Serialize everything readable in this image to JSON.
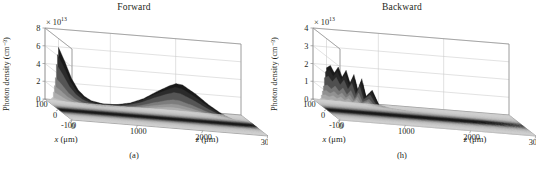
{
  "figure": {
    "background_color": "#ffffff",
    "text_color": "#231f20",
    "panels": [
      {
        "id": "a",
        "title": "Forward",
        "caption": "(a)",
        "ylabel": "Photon density (cm⁻³)",
        "xlabel_var": "x",
        "xlabel_unit": "(μm)",
        "zlabel_var": "z",
        "zlabel_unit": "(μm)",
        "exponent_prefix": "× 10",
        "exponent_power": "13"
      },
      {
        "id": "b",
        "title": "Backward",
        "caption": "(h)",
        "ylabel": "Photon density (cm⁻³)",
        "xlabel_var": "x",
        "xlabel_unit": "(μm)",
        "zlabel_var": "z",
        "zlabel_unit": "(μm)",
        "exponent_prefix": "× 10",
        "exponent_power": "13"
      }
    ]
  },
  "chart_data": [
    {
      "type": "surface",
      "panel": "a",
      "title": "Forward",
      "caption": "(a)",
      "xlabel": "x (μm)",
      "ylabel": "Photon density (cm⁻³)",
      "zlabel": "z (μm)",
      "y_exponent": 13,
      "y_exponent_label": "× 10¹³",
      "ylim": [
        0,
        8
      ],
      "yticks": [
        0,
        2,
        4,
        6,
        8
      ],
      "xlim": [
        -100,
        100
      ],
      "xticks": [
        100,
        0,
        -100
      ],
      "zlim": [
        0,
        3000
      ],
      "zticks": [
        0,
        1000,
        2000,
        3000
      ],
      "grid": true,
      "legend": "none",
      "surface_color_low": "#d2d2d2",
      "surface_color_high": "#1c1c1c",
      "description": "Sharp tall photon-density spike at z near 0 reaching about 7e13, decaying rapidly, followed by a broad secondary hump centred near z = 1800 peaking near 4e13, narrow in x about x = 0.",
      "z_profile": {
        "z": [
          0,
          100,
          200,
          300,
          400,
          500,
          700,
          900,
          1100,
          1300,
          1500,
          1700,
          1800,
          1900,
          2100,
          2300,
          2500,
          2700,
          3000
        ],
        "peak_value": [
          7.0,
          5.4,
          3.6,
          2.4,
          1.7,
          1.3,
          1.0,
          1.1,
          1.4,
          2.0,
          2.9,
          3.7,
          4.0,
          3.9,
          3.0,
          1.9,
          1.0,
          0.4,
          0.05
        ]
      },
      "x_profile": {
        "x": [
          -100,
          -70,
          -45,
          -25,
          -12,
          0,
          12,
          25,
          45,
          70,
          100
        ],
        "relative_amplitude": [
          0.0,
          0.03,
          0.12,
          0.42,
          0.8,
          1.0,
          0.8,
          0.42,
          0.12,
          0.03,
          0.0
        ]
      }
    },
    {
      "type": "surface",
      "panel": "b",
      "title": "Backward",
      "caption": "(h)",
      "xlabel": "x (μm)",
      "ylabel": "Photon density (cm⁻³)",
      "zlabel": "z (μm)",
      "y_exponent": 13,
      "y_exponent_label": "× 10¹³",
      "ylim": [
        0,
        4
      ],
      "yticks": [
        0,
        1,
        2,
        3,
        4
      ],
      "xlim": [
        -100,
        100
      ],
      "xticks": [
        100,
        0,
        -100
      ],
      "zlim": [
        0,
        3000
      ],
      "zticks": [
        0,
        1000,
        2000,
        3000
      ],
      "grid": true,
      "legend": "none",
      "surface_color_low": "#d2d2d2",
      "surface_color_high": "#1c1c1c",
      "description": "Jagged cluster of narrow photon-density spikes confined near z = 0 peaking about 2.5e13, with a faint low ridge trailing toward larger z and vanishing before z = 3000.",
      "z_profile": {
        "z": [
          0,
          60,
          120,
          180,
          240,
          300,
          360,
          420,
          480,
          540,
          600,
          700,
          800,
          1000,
          1400,
          1800,
          2200,
          2600,
          3000
        ],
        "peak_value": [
          2.35,
          2.5,
          2.1,
          2.45,
          1.9,
          2.3,
          1.6,
          2.1,
          1.2,
          1.9,
          0.9,
          1.3,
          0.5,
          0.35,
          0.22,
          0.15,
          0.09,
          0.04,
          0.0
        ]
      },
      "x_profile": {
        "x": [
          -100,
          -70,
          -45,
          -25,
          -12,
          0,
          12,
          25,
          45,
          70,
          100
        ],
        "relative_amplitude": [
          0.0,
          0.04,
          0.15,
          0.45,
          0.82,
          1.0,
          0.82,
          0.45,
          0.15,
          0.04,
          0.0
        ]
      }
    }
  ]
}
